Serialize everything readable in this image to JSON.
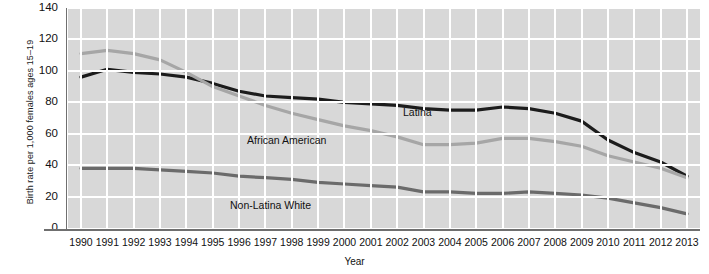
{
  "chart_data": {
    "type": "line",
    "title": "",
    "xlabel": "Year",
    "ylabel": "Birth rate per 1,000 females ages 15–19",
    "xlim": [
      1990,
      2013
    ],
    "ylim": [
      0,
      140
    ],
    "yticks": [
      0,
      20,
      40,
      60,
      80,
      100,
      120,
      140
    ],
    "grid": true,
    "legend_position": "inline-annotations",
    "categories": [
      "1990",
      "1991",
      "1992",
      "1993",
      "1994",
      "1995",
      "1996",
      "1997",
      "1998",
      "1999",
      "2000",
      "2001",
      "2002",
      "2003",
      "2004",
      "2005",
      "2006",
      "2007",
      "2008",
      "2009",
      "2010",
      "2011",
      "2012",
      "2013"
    ],
    "series": [
      {
        "name": "Latina",
        "color": "#1c1c1c",
        "values": [
          96,
          101,
          99,
          98,
          96,
          92,
          87,
          84,
          83,
          82,
          80,
          79,
          78,
          76,
          75,
          75,
          77,
          76,
          73,
          68,
          56,
          48,
          42,
          33
        ]
      },
      {
        "name": "African American",
        "color": "#a6a6a6",
        "values": [
          111,
          113,
          111,
          107,
          99,
          90,
          84,
          78,
          73,
          69,
          65,
          62,
          58,
          53,
          53,
          54,
          57,
          57,
          55,
          52,
          46,
          42,
          38,
          32
        ]
      },
      {
        "name": "Non-Latina White",
        "color": "#6b6b6b",
        "values": [
          38,
          38,
          38,
          37,
          36,
          35,
          33,
          32,
          31,
          29,
          28,
          27,
          26,
          23,
          23,
          22,
          22,
          23,
          22,
          21,
          19,
          16,
          13,
          9
        ]
      }
    ],
    "annotations": [
      {
        "text": "Latina",
        "series": "Latina"
      },
      {
        "text": "African American",
        "series": "African American"
      },
      {
        "text": "Non-Latina White",
        "series": "Non-Latina White"
      }
    ],
    "colors": {
      "plot_background": "#d8d8d8",
      "gridline": "#ffffff",
      "axis": "#6f6f6f",
      "text": "#111111"
    }
  }
}
